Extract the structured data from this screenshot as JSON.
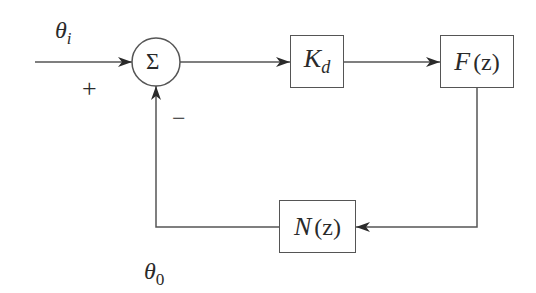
{
  "diagram": {
    "type": "block-diagram",
    "input_signal": {
      "symbol": "θ",
      "subscript": "i"
    },
    "output_signal": {
      "symbol": "θ",
      "subscript": "0"
    },
    "summing_junction": {
      "symbol": "Σ",
      "plus_sign": "+",
      "minus_sign": "−"
    },
    "blocks": [
      {
        "id": "kd",
        "main": "K",
        "subscript": "d"
      },
      {
        "id": "fz",
        "main": "F",
        "argument": "(z)"
      },
      {
        "id": "nz",
        "main": "N",
        "argument": "(z)"
      }
    ],
    "connections": [
      {
        "from": "input",
        "to": "summing_junction",
        "sign": "+"
      },
      {
        "from": "summing_junction",
        "to": "kd"
      },
      {
        "from": "kd",
        "to": "fz"
      },
      {
        "from": "fz",
        "to": "nz"
      },
      {
        "from": "nz",
        "to": "summing_junction",
        "sign": "−"
      }
    ],
    "colors": {
      "line": "#555555",
      "text": "#2a2a2a",
      "background": "#ffffff"
    }
  }
}
